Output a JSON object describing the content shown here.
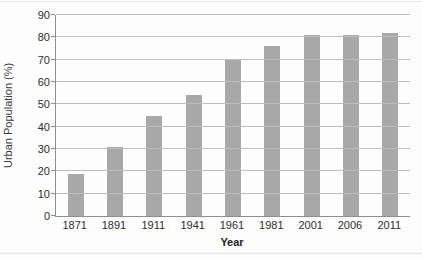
{
  "chart_data": {
    "type": "bar",
    "categories": [
      "1871",
      "1891",
      "1911",
      "1941",
      "1961",
      "1981",
      "2001",
      "2006",
      "2011"
    ],
    "values": [
      19,
      31,
      45,
      54,
      70,
      76,
      81,
      81,
      82
    ],
    "title": "",
    "xlabel": "Year",
    "ylabel": "Urban Population (%)",
    "ylim": [
      0,
      90
    ],
    "yticks": [
      0,
      10,
      20,
      30,
      40,
      50,
      60,
      70,
      80,
      90
    ],
    "grid": true,
    "legend": "none",
    "bar_color": "#a8a8a8",
    "gridline_color": "#bdbdbd",
    "axis_color": "#8f8f8f",
    "text_color": "#2e2e2e"
  }
}
